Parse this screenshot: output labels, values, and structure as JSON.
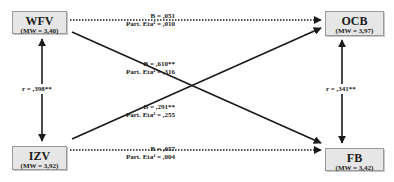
{
  "diagram": {
    "type": "path-model",
    "nodes": [
      {
        "id": "WFV",
        "label": "WFV",
        "mean_label": "(MW = 3,40)",
        "mean": 3.4
      },
      {
        "id": "OCB",
        "label": "OCB",
        "mean_label": "(MW = 3,97)",
        "mean": 3.97
      },
      {
        "id": "IZV",
        "label": "IZV",
        "mean_label": "(MW = 3,92)",
        "mean": 3.92
      },
      {
        "id": "FB",
        "label": "FB",
        "mean_label": "(MW = 3,42)",
        "mean": 3.42
      }
    ],
    "correlations": [
      {
        "from": "WFV",
        "to": "IZV",
        "label": "r = ,398**"
      },
      {
        "from": "OCB",
        "to": "FB",
        "label": "r = ,341**"
      }
    ],
    "paths": [
      {
        "from": "WFV",
        "to": "OCB",
        "style": "dotted",
        "b_label": "B = ,051",
        "eta_label": "Part. Eta² = ,010"
      },
      {
        "from": "WFV",
        "to": "FB",
        "style": "solid",
        "b_label": "B = ,610**",
        "eta_label": "Part. Eta² = ,316"
      },
      {
        "from": "IZV",
        "to": "OCB",
        "style": "solid",
        "b_label": "B = ,291**",
        "eta_label": "Part. Eta² = ,255"
      },
      {
        "from": "IZV",
        "to": "FB",
        "style": "dotted",
        "b_label": "B = ,057",
        "eta_label": "Part. Eta² = ,004"
      }
    ]
  },
  "colors": {
    "box_fill": "#e6e6e6",
    "box_border": "#9a9a9a",
    "line": "#1a1a1a"
  }
}
